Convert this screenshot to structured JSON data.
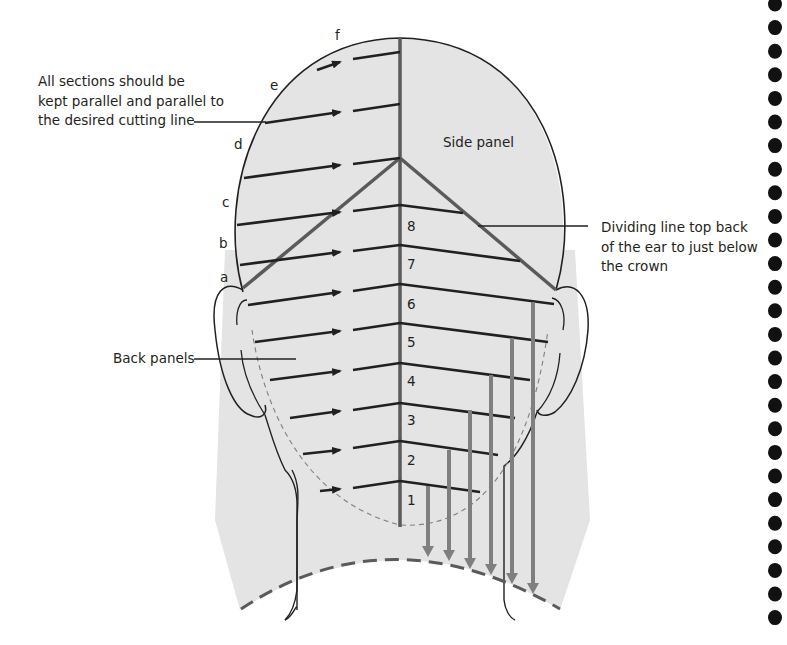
{
  "diagram": {
    "annotations": {
      "sections_note": [
        "All sections should be",
        "kept parallel and parallel to",
        "the desired cutting line"
      ],
      "side_panel": "Side panel",
      "dividing_line": [
        "Dividing line top back",
        "of the ear to just below",
        "the crown"
      ],
      "back_panels": "Back panels"
    },
    "left_section_letters": [
      "a",
      "b",
      "c",
      "d",
      "e",
      "f"
    ],
    "section_numbers": [
      "1",
      "2",
      "3",
      "4",
      "5",
      "6",
      "7",
      "8"
    ],
    "colors": {
      "head_fill": "#e4e4e4",
      "outline": "#231f20",
      "section_lines": "#3a3a3a",
      "divider_lines": "#5a5a5a",
      "guide_arrows": "#7f7f7f",
      "binding_dots": "#111111"
    },
    "binding_dot_count": 27
  }
}
